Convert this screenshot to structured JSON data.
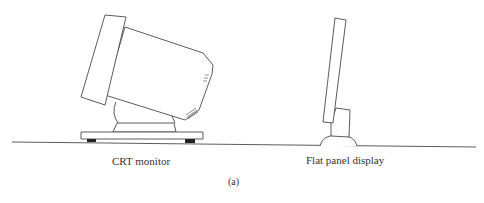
{
  "figure": {
    "subfigure_label": "(a)",
    "crt": {
      "label": "CRT monitor"
    },
    "flat_panel": {
      "label": "Flat panel display"
    }
  },
  "colors": {
    "stroke": "#4a4a4a",
    "feet": "#222222",
    "background": "#ffffff"
  }
}
